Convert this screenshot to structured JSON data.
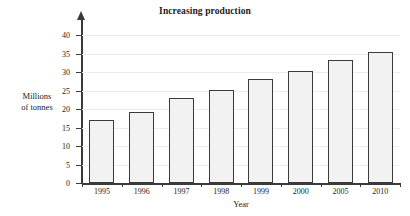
{
  "chart_data": {
    "type": "bar",
    "title": "Increasing production",
    "xlabel": "Year",
    "ylabel_line1": "Millions",
    "ylabel_line2": "of tonnes",
    "categories": [
      "1995",
      "1996",
      "1997",
      "1998",
      "1999",
      "2000",
      "2005",
      "2010"
    ],
    "values": [
      17.0,
      19.1,
      23.0,
      25.2,
      28.2,
      30.2,
      33.3,
      35.3
    ],
    "ylim": [
      0,
      40
    ],
    "yticks": [
      0,
      5,
      10,
      15,
      20,
      25,
      30,
      35,
      40
    ],
    "ytick_labels": [
      "0",
      "5",
      "10",
      "15",
      "20",
      "25",
      "30",
      "35",
      "40"
    ],
    "grid": true,
    "legend": null,
    "bar_fill": "#f2f2f2",
    "bar_border": "#3b3b3b",
    "axis_color": "#3a3a3a",
    "grid_color": "#ececec",
    "text_color": "#1c1c1c",
    "background": "#ffffff"
  }
}
